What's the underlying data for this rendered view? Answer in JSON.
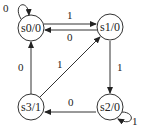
{
  "diagram": {
    "type": "moore-state-machine",
    "states": [
      {
        "id": "s0",
        "label": "s0/0"
      },
      {
        "id": "s1",
        "label": "s1/0"
      },
      {
        "id": "s2",
        "label": "s2/0"
      },
      {
        "id": "s3",
        "label": "s3/1"
      }
    ],
    "transitions": [
      {
        "from": "s0",
        "to": "s0",
        "label": "0"
      },
      {
        "from": "s0",
        "to": "s1",
        "label": "1"
      },
      {
        "from": "s1",
        "to": "s0",
        "label": "0"
      },
      {
        "from": "s1",
        "to": "s2",
        "label": "1"
      },
      {
        "from": "s2",
        "to": "s2",
        "label": "1"
      },
      {
        "from": "s2",
        "to": "s3",
        "label": "0"
      },
      {
        "from": "s3",
        "to": "s0",
        "label": "0"
      },
      {
        "from": "s3",
        "to": "s1",
        "label": "1"
      }
    ]
  }
}
